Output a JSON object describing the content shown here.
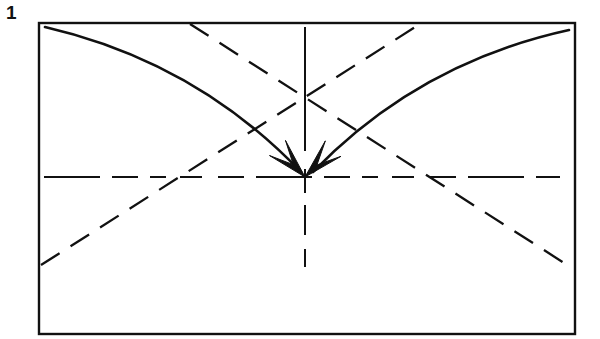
{
  "figure": {
    "step_label": "1",
    "caption": "",
    "background_color": "#ffffff",
    "ink_color": "#111111",
    "canvas": {
      "width": 600,
      "height": 339
    }
  },
  "frame": {
    "name": "paper-sheet-outline",
    "shape": "rectangle",
    "x": 39,
    "y": 23,
    "width": 536,
    "height": 311,
    "stroke_color": "#111111",
    "stroke_width": 2.4
  },
  "crease_lines": [
    {
      "name": "horizontal-crease",
      "orientation": "horizontal",
      "style": "dashed",
      "x1": 44,
      "y1": 177,
      "x2": 560,
      "y2": 177,
      "dash_pattern": "56 12 26 12 16 14 22 16 26 12"
    },
    {
      "name": "vertical-crease",
      "orientation": "vertical",
      "style": "dashed",
      "x1": 305,
      "y1": 27,
      "x2": 305,
      "y2": 312,
      "dash_pattern": "124 18 24 12 30 14 18"
    },
    {
      "name": "diagonal-crease-rising",
      "orientation": "diagonal",
      "style": "dashed",
      "x1": 41,
      "y1": 265,
      "x2": 420,
      "y2": 24,
      "dash_pattern": "22 13"
    },
    {
      "name": "diagonal-crease-falling",
      "orientation": "diagonal",
      "style": "dashed",
      "x1": 190,
      "y1": 24,
      "x2": 572,
      "y2": 268,
      "dash_pattern": "22 13"
    }
  ],
  "fold_arrows": [
    {
      "name": "fold-arrow-left",
      "direction": "to-center",
      "style": "solid-curved",
      "start": {
        "x": 45,
        "y": 27
      },
      "control": {
        "x": 196,
        "y": 62
      },
      "end": {
        "x": 301,
        "y": 172
      },
      "arrowhead": "barbed"
    },
    {
      "name": "fold-arrow-right",
      "direction": "to-center",
      "style": "solid-curved",
      "start": {
        "x": 569,
        "y": 30
      },
      "control": {
        "x": 418,
        "y": 63
      },
      "end": {
        "x": 313,
        "y": 172
      },
      "arrowhead": "barbed"
    }
  ],
  "center_point": {
    "name": "center-mark",
    "x": 305,
    "y": 177
  }
}
